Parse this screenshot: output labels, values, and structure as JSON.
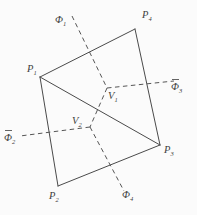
{
  "figure": {
    "background_color": "#fbfbfb",
    "line_color": "#4a4a4a",
    "labels": {
      "p1": {
        "symbol": "P",
        "sub": "1"
      },
      "p2": {
        "symbol": "P",
        "sub": "2"
      },
      "p3": {
        "symbol": "P",
        "sub": "3"
      },
      "p4": {
        "symbol": "P",
        "sub": "4"
      },
      "v_upper": {
        "symbol": "V",
        "sub": "1"
      },
      "v_lower": {
        "symbol": "V",
        "sub": "2"
      },
      "phi1": {
        "symbol": "Φ",
        "sub": "1",
        "bar": false
      },
      "phi2": {
        "symbol": "Φ",
        "sub": "2",
        "bar": true
      },
      "phi3": {
        "symbol": "Φ",
        "sub": "3",
        "bar": true
      },
      "phi4": {
        "symbol": "Φ",
        "sub": "4",
        "bar": false
      }
    }
  }
}
